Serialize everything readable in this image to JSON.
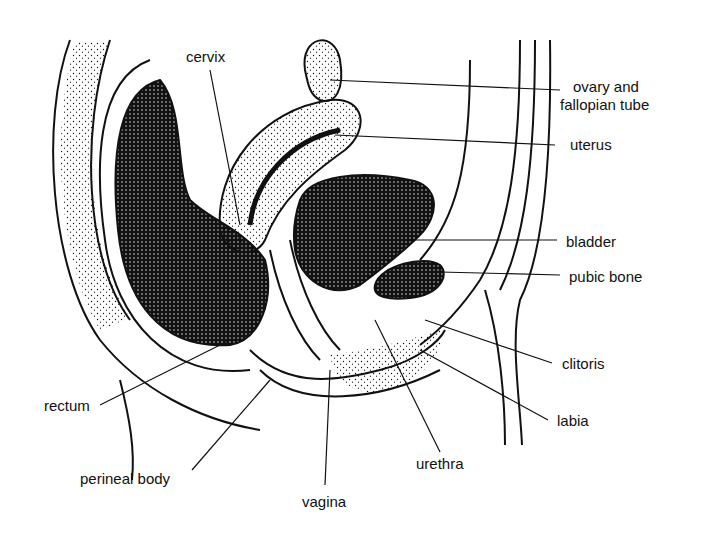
{
  "labels": {
    "cervix": "cervix",
    "ovary_line1": "ovary and",
    "ovary_line2": "fallopian tube",
    "uterus": "uterus",
    "bladder": "bladder",
    "pubic_bone": "pubic bone",
    "clitoris": "clitoris",
    "labia": "labia",
    "urethra": "urethra",
    "vagina": "vagina",
    "perineal_body": "perineal body",
    "rectum": "rectum"
  },
  "colors": {
    "ink": "#111111",
    "background": "#ffffff"
  }
}
